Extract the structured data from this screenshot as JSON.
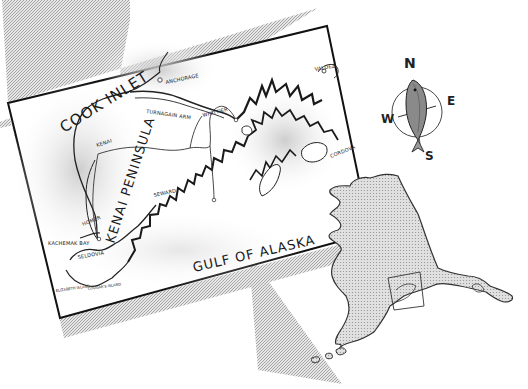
{
  "map": {
    "title": "KENAI PENINSULA",
    "water_labels": {
      "cook_inlet": "COOK INLET",
      "gulf_of_alaska": "GULF OF ALASKA",
      "kachemak_bay": "KACHEMAK BAY"
    },
    "towns": [
      {
        "id": "anchorage",
        "label": "ANCHORAGE"
      },
      {
        "id": "turnagain-arm",
        "label": "TURNAGAIN ARM"
      },
      {
        "id": "whittier",
        "label": "WHITTIER"
      },
      {
        "id": "valdez",
        "label": "VALDEZ"
      },
      {
        "id": "kenai",
        "label": "KENAI"
      },
      {
        "id": "seward",
        "label": "SEWARD"
      },
      {
        "id": "cordova",
        "label": "CORDOVA"
      },
      {
        "id": "homer",
        "label": "HOMER"
      },
      {
        "id": "seldovia",
        "label": "SELDOVIA"
      },
      {
        "id": "elizabeth-island",
        "label": "ELIZABETH ISLAND"
      },
      {
        "id": "cougars-island",
        "label": "COUGAR'S ISLAND"
      }
    ],
    "colors": {
      "ink": "#1a1a1a",
      "paper": "#ffffff",
      "shadow": "#b8b8b8",
      "land_fill": "#d6d6d6",
      "stipple": "#9a9a9a"
    }
  },
  "compass": {
    "n": "N",
    "e": "E",
    "s": "S",
    "w": "W",
    "icon": "fish-compass-rose"
  },
  "inset": {
    "name": "Alaska state locator",
    "highlight": "Kenai Peninsula area box"
  }
}
